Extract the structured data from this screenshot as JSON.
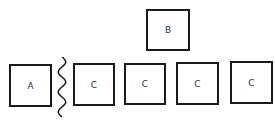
{
  "diagram": {
    "top_row": [
      {
        "id": "B",
        "label": "B",
        "x": 146,
        "y": 9,
        "w": 44,
        "h": 42
      }
    ],
    "bottom_row": [
      {
        "id": "A",
        "label": "A",
        "x": 9,
        "y": 64,
        "w": 43,
        "h": 43
      },
      {
        "id": "C1",
        "label": "C",
        "x": 73,
        "y": 63,
        "w": 42,
        "h": 43
      },
      {
        "id": "C2",
        "label": "C",
        "x": 124,
        "y": 63,
        "w": 42,
        "h": 42
      },
      {
        "id": "C3",
        "label": "C",
        "x": 176,
        "y": 62,
        "w": 43,
        "h": 43
      },
      {
        "id": "C4",
        "label": "C",
        "x": 230,
        "y": 61,
        "w": 43,
        "h": 43
      }
    ],
    "separator": {
      "type": "wavy-line",
      "between": [
        "A",
        "C1"
      ]
    },
    "colors": {
      "stroke": "#1a1a1a",
      "text": "#333333",
      "background": "#ffffff"
    }
  }
}
